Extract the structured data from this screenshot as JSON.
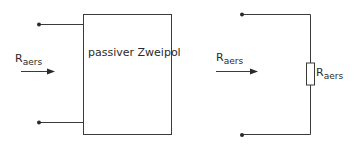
{
  "left_diagram": {
    "box_label": "passiver Zweipol",
    "arrow_label": {
      "main": "R",
      "sub": "aers"
    }
  },
  "right_diagram": {
    "arrow_label": {
      "main": "R",
      "sub": "aers"
    },
    "resistor_label": {
      "main": "R",
      "sub": "aers"
    }
  },
  "colors": {
    "line": "#3a3a3a",
    "background": "#ffffff"
  }
}
